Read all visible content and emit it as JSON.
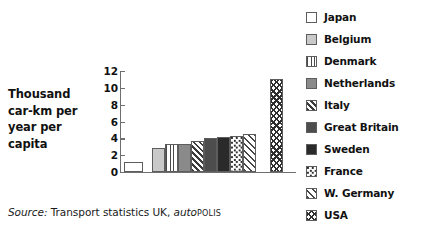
{
  "axis_label": {
    "lines": [
      "Thousand",
      "car-km per",
      "year per",
      "capita"
    ]
  },
  "source": {
    "prefix": "Source:",
    "text": " Transport statistics UK, ",
    "brand_italic": "auto",
    "brand_smallcaps": "POLIS"
  },
  "legend": {
    "items": [
      {
        "label": "Japan",
        "pattern": "p-white"
      },
      {
        "label": "Belgium",
        "pattern": "p-lightgray"
      },
      {
        "label": "Denmark",
        "pattern": "p-vlines"
      },
      {
        "label": "Netherlands",
        "pattern": "p-medgray"
      },
      {
        "label": "Italy",
        "pattern": "p-hatchlight"
      },
      {
        "label": "Great Britain",
        "pattern": "p-darkgray"
      },
      {
        "label": "Sweden",
        "pattern": "p-black"
      },
      {
        "label": "France",
        "pattern": "p-dots"
      },
      {
        "label": "W. Germany",
        "pattern": "p-diagstripe"
      },
      {
        "label": "USA",
        "pattern": "p-checker"
      }
    ]
  },
  "chart_data": {
    "type": "bar",
    "title": "",
    "xlabel": "",
    "ylabel": "Thousand car-km per year per capita",
    "ylim": [
      0,
      12
    ],
    "yticks": [
      0,
      2,
      4,
      6,
      8,
      10,
      12
    ],
    "grid": false,
    "legend_position": "right",
    "categories": [
      "Japan",
      "Belgium",
      "Denmark",
      "Netherlands",
      "Italy",
      "Great Britain",
      "Sweden",
      "France",
      "W. Germany",
      "USA"
    ],
    "values": [
      1.2,
      2.9,
      3.3,
      3.3,
      3.7,
      4.0,
      4.15,
      4.3,
      4.5,
      11.0
    ],
    "patterns": [
      "p-white",
      "p-lightgray",
      "p-vlines",
      "p-medgray",
      "p-hatchlight",
      "p-darkgray",
      "p-black",
      "p-dots",
      "p-diagstripe",
      "p-checker"
    ],
    "bar_x": [
      2,
      30,
      43,
      56,
      69,
      82,
      95,
      108,
      121,
      148
    ],
    "bar_width": [
      19,
      13,
      13,
      13,
      13,
      13,
      13,
      13,
      13,
      13
    ]
  }
}
